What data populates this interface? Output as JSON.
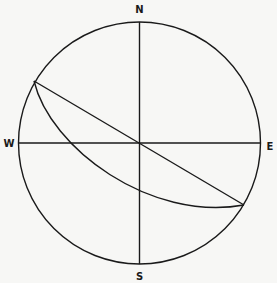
{
  "diagram": {
    "type": "stereonet-projection",
    "labels": {
      "north": "N",
      "south": "S",
      "west": "W",
      "east": "E"
    },
    "elements": [
      {
        "name": "primitive-circle",
        "kind": "circle"
      },
      {
        "name": "north-south-axis",
        "kind": "line"
      },
      {
        "name": "west-east-axis",
        "kind": "line"
      },
      {
        "name": "strike-line",
        "kind": "chord through center"
      },
      {
        "name": "great-circle-arc",
        "kind": "arc"
      }
    ],
    "colors": {
      "stroke": "#1a1a1a",
      "background": "#f7f7f5"
    }
  }
}
